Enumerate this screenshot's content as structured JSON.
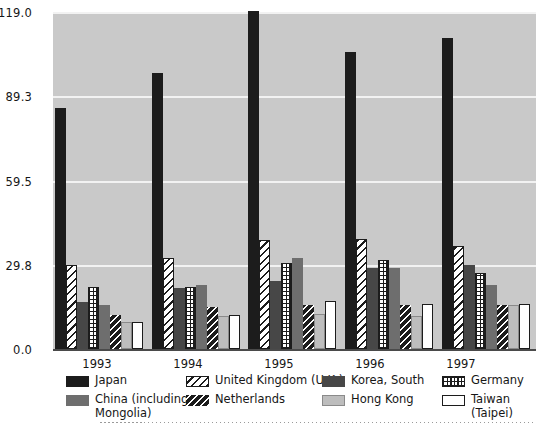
{
  "chart_data": {
    "type": "bar",
    "title": "",
    "xlabel": "",
    "ylabel": "",
    "grid": true,
    "legend_position": "bottom",
    "ylim": [
      0.0,
      119.0
    ],
    "yticks": [
      0.0,
      29.8,
      59.5,
      89.3,
      119.0
    ],
    "ytick_labels": [
      "0.0",
      "29.8",
      "59.5",
      "89.3",
      "119.0"
    ],
    "categories": [
      "1993",
      "1994",
      "1995",
      "1996",
      "1997"
    ],
    "series": [
      {
        "name": "Japan",
        "swatch": "solid-black",
        "values": [
          85.0,
          97.5,
          119.5,
          105.0,
          110.0
        ]
      },
      {
        "name": "United Kingdom (U.K.)",
        "swatch": "diagonal-hatch",
        "values": [
          29.5,
          32.0,
          38.5,
          39.0,
          36.5
        ]
      },
      {
        "name": "Korea, South",
        "swatch": "solid-dark-gray",
        "values": [
          16.5,
          21.5,
          24.0,
          28.5,
          29.5
        ]
      },
      {
        "name": "Germany",
        "swatch": "grid-hatch",
        "values": [
          22.0,
          22.0,
          30.5,
          31.5,
          27.0
        ]
      },
      {
        "name": "China (including\nMongolia)",
        "swatch": "solid-mid-gray",
        "values": [
          15.5,
          22.5,
          32.0,
          28.5,
          22.5
        ]
      },
      {
        "name": "Netherlands",
        "swatch": "black-diagonal",
        "values": [
          12.0,
          15.0,
          15.5,
          15.5,
          15.5
        ]
      },
      {
        "name": "Hong Kong",
        "swatch": "solid-light-gray",
        "values": [
          9.5,
          11.5,
          12.5,
          11.5,
          15.5
        ]
      },
      {
        "name": "Taiwan\n(Taipei)",
        "swatch": "white-outline",
        "values": [
          9.5,
          12.0,
          17.0,
          16.0,
          16.0
        ]
      }
    ]
  },
  "legend": {
    "items": [
      {
        "label": "Japan"
      },
      {
        "label": "United Kingdom (U.K.)"
      },
      {
        "label": "Korea, South"
      },
      {
        "label": "Germany"
      },
      {
        "label": "China (including\nMongolia)"
      },
      {
        "label": "Netherlands"
      },
      {
        "label": "Hong Kong"
      },
      {
        "label": "Taiwan\n(Taipei)"
      }
    ]
  },
  "colors": {
    "plot_background": "#c9c9c9",
    "gridline": "#f2f2f2",
    "axis": "#4a4a4a",
    "text": "#161616",
    "japan": "#1c1c1c",
    "korea": "#474747",
    "china": "#6e6e6e",
    "hong_kong": "#bdbdbd",
    "taiwan": "#ffffff"
  }
}
